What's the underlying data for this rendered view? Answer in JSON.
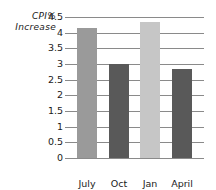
{
  "chart_data": {
    "type": "bar",
    "title": "",
    "xlabel": "",
    "ylabel": "CPI% Increase",
    "ylabel_lines": [
      "CPI%",
      "Increase"
    ],
    "categories": [
      "July 2000",
      "Oct 2000",
      "Jan 2001",
      "April 2001"
    ],
    "category_lines": [
      [
        "July",
        "2000"
      ],
      [
        "Oct",
        "2000"
      ],
      [
        "Jan",
        "2001"
      ],
      [
        "April",
        "2001"
      ]
    ],
    "values": [
      4.15,
      3.0,
      4.35,
      2.85
    ],
    "ylim": [
      0,
      4.5
    ],
    "ytick_step": 0.5,
    "yticks": [
      "4.5",
      "4",
      "3.5",
      "3",
      "2.5",
      "2",
      "1.5",
      "1",
      "0.5",
      "0"
    ],
    "ytick_values": [
      4.5,
      4,
      3.5,
      3,
      2.5,
      2,
      1.5,
      1,
      0.5,
      0
    ],
    "grid": true,
    "legend": false,
    "bar_colors": [
      "#9a9a9a",
      "#595959",
      "#c6c6c6",
      "#595959"
    ],
    "grid_color": "#8a8a8a",
    "text_color": "#1a1a1a",
    "background": "#ffffff"
  }
}
